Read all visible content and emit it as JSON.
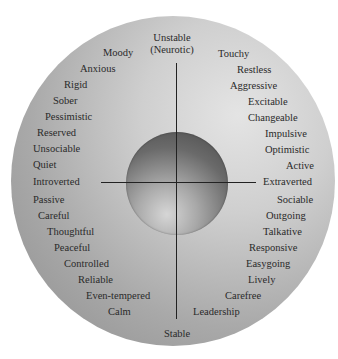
{
  "diagram": {
    "type": "personality-circumplex",
    "axes": {
      "top": {
        "line1": "Unstable",
        "line2": "(Neurotic)"
      },
      "bottom": "Stable",
      "left": "Introverted",
      "right": "Extraverted"
    },
    "quadrants": {
      "upper_left": [
        "Moody",
        "Anxious",
        "Rigid",
        "Sober",
        "Pessimistic",
        "Reserved",
        "Unsociable",
        "Quiet"
      ],
      "upper_right": [
        "Touchy",
        "Restless",
        "Aggressive",
        "Excitable",
        "Changeable",
        "Impulsive",
        "Optimistic",
        "Active"
      ],
      "lower_left": [
        "Passive",
        "Careful",
        "Thoughtful",
        "Peaceful",
        "Controlled",
        "Reliable",
        "Even-tempered",
        "Calm"
      ],
      "lower_right": [
        "Sociable",
        "Outgoing",
        "Talkative",
        "Responsive",
        "Easygoing",
        "Lively",
        "Carefree",
        "Leadership"
      ]
    },
    "colors": {
      "disc_light": "#e4e4e4",
      "disc_dark": "#8d8d8d",
      "sphere_dark": "#4a4a4a",
      "text": "#2a2a2a",
      "axis": "#222222"
    }
  }
}
